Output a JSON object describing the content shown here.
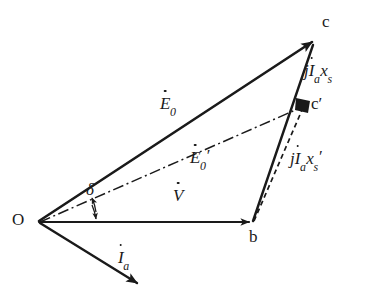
{
  "diagram": {
    "background_color": "#ffffff",
    "stroke_color": "#1a1a1a",
    "points": [
      {
        "id": "O",
        "label": "O",
        "x": 38,
        "y": 222
      },
      {
        "id": "b",
        "label": "b",
        "x": 253,
        "y": 222
      },
      {
        "id": "c",
        "label": "c",
        "x": 316,
        "y": 38
      },
      {
        "id": "cp",
        "label": "c′",
        "x": 305,
        "y": 105
      }
    ],
    "vectors": [
      {
        "name": "E0",
        "label_parts": {
          "base": "E",
          "sub": "0",
          "prime": "",
          "dot": true
        },
        "label_text": "Ė₀",
        "style": "solid",
        "from": "O",
        "to": "c",
        "label_x": 168,
        "label_y": 104
      },
      {
        "name": "E0-prime",
        "label_parts": {
          "base": "E",
          "sub": "0",
          "prime": "′",
          "dot": true
        },
        "label_text": "Ė₀′",
        "style": "dash-dot",
        "from": "O",
        "to": "cp",
        "label_x": 196,
        "label_y": 158
      },
      {
        "name": "V",
        "label_parts": {
          "base": "V",
          "sub": "",
          "prime": "",
          "dot": true
        },
        "label_text": "V̇",
        "style": "solid",
        "from": "O",
        "to": "b",
        "label_x": 178,
        "label_y": 196
      },
      {
        "name": "Ia",
        "label_parts": {
          "base": "I",
          "sub": "a",
          "prime": "",
          "dot": true
        },
        "label_text": "İₐ",
        "style": "solid",
        "from": "O",
        "to": "Ia-tip",
        "label_x": 124,
        "label_y": 258
      },
      {
        "name": "jIaXs",
        "label_parts": {
          "j": "j",
          "base": "I",
          "sub": "a",
          "x": "x",
          "xsub": "s",
          "prime": "",
          "dot": true
        },
        "label_text": "jİₐxₛ",
        "style": "solid",
        "from": "b",
        "to": "c",
        "label_x": 313,
        "label_y": 72
      },
      {
        "name": "jIaXsPrime",
        "label_parts": {
          "j": "j",
          "base": "I",
          "sub": "a",
          "x": "x",
          "xsub": "s",
          "prime": "′",
          "dot": true
        },
        "label_text": "jİₐxₛ′",
        "style": "dashed",
        "from": "b",
        "to": "cp",
        "label_x": 300,
        "label_y": 160
      }
    ],
    "angle": {
      "name": "delta",
      "label": "δ",
      "label_x": 90,
      "label_y": 190,
      "between": [
        "E0-prime",
        "V"
      ],
      "arc_arrows": "both"
    }
  }
}
